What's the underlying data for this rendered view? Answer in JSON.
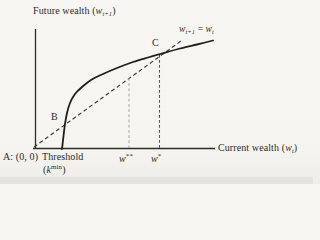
{
  "figure": {
    "colors": {
      "bg": "#f6f5f1",
      "ink": "#2e2c29",
      "curve": "#201f1d",
      "identity": "#3c3a36",
      "vline_dark": "#57544f",
      "vline_light": "#a29f99"
    },
    "labels": {
      "y_axis": [
        {
          "t": "Future wealth ("
        },
        {
          "t": "w",
          "s": "i"
        },
        {
          "t": "t+1",
          "s": "sub"
        },
        {
          "t": ")"
        }
      ],
      "x_axis": [
        {
          "t": "Current wealth ("
        },
        {
          "t": "w",
          "s": "i"
        },
        {
          "t": "t",
          "s": "sub"
        },
        {
          "t": ")"
        }
      ],
      "identity_line": [
        {
          "t": "w",
          "s": "i"
        },
        {
          "t": "t+1",
          "s": "sub"
        },
        {
          "t": " = "
        },
        {
          "t": "w",
          "s": "i"
        },
        {
          "t": "t",
          "s": "sub"
        }
      ],
      "point_a": [
        {
          "t": "A: (0, 0)"
        }
      ],
      "point_b": [
        {
          "t": "B"
        }
      ],
      "point_c": [
        {
          "t": "C"
        }
      ],
      "threshold_line1": [
        {
          "t": "Threshold"
        }
      ],
      "threshold_line2": [
        {
          "t": "("
        },
        {
          "t": "k",
          "s": "i"
        },
        {
          "t": "min",
          "s": "sup"
        },
        {
          "t": ")"
        }
      ],
      "w_double_star": [
        {
          "t": "w",
          "s": "i"
        },
        {
          "t": "**",
          "s": "sup"
        }
      ],
      "w_star": [
        {
          "t": "w",
          "s": "i"
        },
        {
          "t": "*",
          "s": "sup"
        }
      ]
    },
    "geometry_px": {
      "canvas": {
        "width": 313,
        "height": 184
      },
      "axes": {
        "origin_x": 35.5,
        "y_top": 29,
        "y_bottom": 148.5,
        "x_left": 33,
        "x_right": 215
      },
      "wealth_curve_points": [
        [
          62,
          149
        ],
        [
          63.5,
          136
        ],
        [
          65,
          124
        ],
        [
          67,
          113
        ],
        [
          70,
          103
        ],
        [
          75,
          94
        ],
        [
          82,
          87
        ],
        [
          91,
          80
        ],
        [
          103,
          74
        ],
        [
          117,
          68
        ],
        [
          133,
          62
        ],
        [
          148,
          57.5
        ],
        [
          162,
          53.5
        ],
        [
          180,
          48.5
        ],
        [
          197,
          44.5
        ],
        [
          213,
          40.5
        ]
      ],
      "identity_line": {
        "x1": 34,
        "y1": 147,
        "x2": 181,
        "y2": 41
      },
      "vline_w_star": {
        "x": 159.5,
        "y1": 55,
        "y2": 148
      },
      "vline_w_double_star": {
        "x": 129,
        "y1": 78,
        "y2": 148
      },
      "notable_points": {
        "A": "origin (0,0), stable steady state",
        "B": "curve crosses identity line near (65,124), unstable threshold steady state",
        "C": "curve crosses identity line near (161,54), high stable steady state"
      }
    }
  }
}
